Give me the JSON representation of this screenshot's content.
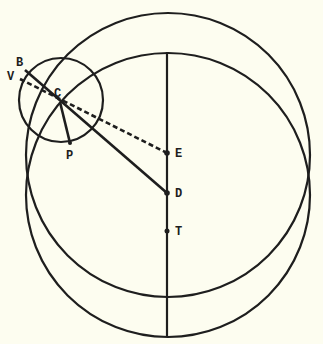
{
  "figure": {
    "colors": {
      "background": "#fdfdf0",
      "ink": "#1e1e1e"
    },
    "labels": {
      "B": "B",
      "V": "V",
      "C": "C",
      "P": "P",
      "E": "E",
      "D": "D",
      "T": "T"
    },
    "points": {
      "C": [
        60,
        102
      ],
      "E": [
        167,
        153
      ],
      "D": [
        167,
        193
      ],
      "T": [
        167,
        231
      ],
      "P_end": [
        70,
        143
      ]
    }
  }
}
